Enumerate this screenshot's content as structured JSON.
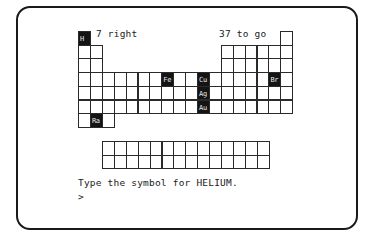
{
  "status": {
    "right_count_text": "7 right",
    "remaining_text": "37 to go"
  },
  "prompt": {
    "question": "Type the symbol for HELIUM.",
    "input_cursor": ">"
  },
  "table": {
    "origin": {
      "x": 78,
      "y": 31
    },
    "cell_w": 11.9,
    "cell_h": 13.7,
    "main_layout": [
      [
        1,
        18
      ],
      [
        1,
        2,
        13,
        14,
        15,
        16,
        17,
        18
      ],
      [
        1,
        2,
        13,
        14,
        15,
        16,
        17,
        18
      ],
      [
        1,
        2,
        3,
        4,
        5,
        6,
        7,
        8,
        9,
        10,
        11,
        12,
        13,
        14,
        15,
        16,
        17,
        18
      ],
      [
        1,
        2,
        3,
        4,
        5,
        6,
        7,
        8,
        9,
        10,
        11,
        12,
        13,
        14,
        15,
        16,
        17,
        18
      ],
      [
        1,
        2,
        3,
        4,
        5,
        6,
        7,
        8,
        9,
        10,
        11,
        12,
        13,
        14,
        15,
        16,
        17,
        18
      ],
      [
        1,
        2,
        3
      ]
    ],
    "lower_block": {
      "origin": {
        "x": 102,
        "y": 141
      },
      "rows": 2,
      "cols": 14
    },
    "answered": [
      {
        "symbol": "H",
        "row": 1,
        "col": 1
      },
      {
        "symbol": "Fe",
        "row": 4,
        "col": 8
      },
      {
        "symbol": "Cu",
        "row": 4,
        "col": 11
      },
      {
        "symbol": "Br",
        "row": 4,
        "col": 17
      },
      {
        "symbol": "Ag",
        "row": 5,
        "col": 11
      },
      {
        "symbol": "Au",
        "row": 6,
        "col": 11
      },
      {
        "symbol": "Ra",
        "row": 7,
        "col": 2
      }
    ]
  },
  "colors": {
    "ink": "#1a1a1a",
    "highlight_bg": "#141414",
    "highlight_text": "#e8e8e8",
    "background": "#ffffff"
  }
}
